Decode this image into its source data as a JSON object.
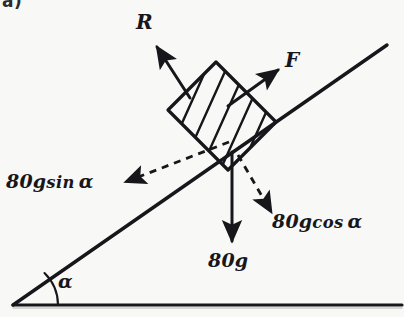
{
  "figure": {
    "part_label": "a)",
    "background_color": "#f8f8f6",
    "ink_color": "#17171b"
  },
  "labels": {
    "normal_reaction": "R",
    "friction_force": "F",
    "weight": "80g",
    "weight_component_parallel": "80g sin α",
    "weight_component_perpendicular": "80g cos α",
    "incline_angle": "α"
  },
  "label_parts": {
    "sin_magnitude": "80",
    "sin_gravity": "g",
    "sin_function": "sin",
    "sin_angle": "α",
    "cos_magnitude": "80",
    "cos_gravity": "g",
    "cos_function": "cos",
    "cos_angle": "α",
    "weight_magnitude": "80",
    "weight_gravity": "g"
  },
  "geometry": {
    "incline_base_point": "13,305",
    "incline_top_point": "387,45",
    "ground_line_start": "13,305",
    "ground_line_end": "402,305",
    "angle_arc_radius": 45,
    "block_center": "222,110"
  },
  "vectors": [
    {
      "name": "normal-reaction",
      "label": "R",
      "style": "solid",
      "direction": "up-left perpendicular to incline",
      "from": "190,98",
      "to": "154,43"
    },
    {
      "name": "friction",
      "label": "F",
      "style": "solid",
      "direction": "up-right parallel to incline",
      "from": "228,106",
      "to": "281,68"
    },
    {
      "name": "weight",
      "label": "80g",
      "style": "solid",
      "direction": "vertically downward",
      "from": "232,152",
      "to": "232,245"
    },
    {
      "name": "weight-component-parallel",
      "label": "80g sin α",
      "style": "dashed",
      "direction": "down-left parallel to incline",
      "from": "228,143",
      "to": "125,183"
    },
    {
      "name": "weight-component-perpendicular",
      "label": "80g cos α",
      "style": "dashed",
      "direction": "down-right perpendicular to incline",
      "from": "238,155",
      "to": "272,214"
    }
  ],
  "block": {
    "name": "hatched-block",
    "shape": "parallelogram",
    "fill": "diagonal hatching",
    "hatch_line_count": 5
  }
}
